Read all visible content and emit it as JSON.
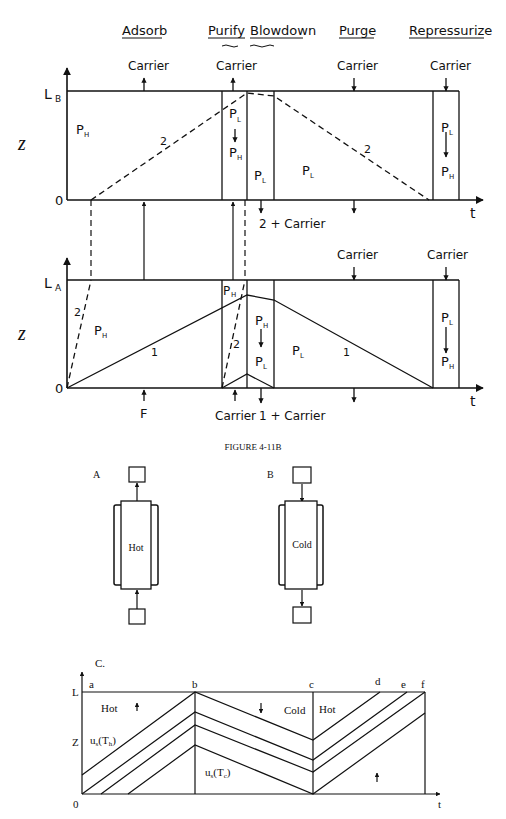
{
  "top_diagram": {
    "step_labels": [
      "Adsorb",
      "Purify",
      "Blowdown",
      "Purge",
      "Repressurize"
    ],
    "column_B": {
      "axis_top": "L",
      "axis_top_sub": "B",
      "axis_zero": "0",
      "y_axis_label": "z",
      "t_label": "t",
      "carrier_labels": [
        "Carrier",
        "Carrier",
        "Carrier",
        "Carrier"
      ],
      "regions": {
        "adsorb": "P",
        "adsorb_sub": "H",
        "purify_top": "P",
        "purify_top_sub": "L",
        "purify_bottom": "P",
        "purify_bottom_sub": "H",
        "blowdown": "P",
        "blowdown_sub": "L",
        "purge": "P",
        "purge_sub": "L",
        "repress_top": "P",
        "repress_top_sub": "L",
        "repress_bottom": "P",
        "repress_bottom_sub": "H"
      },
      "front_labels": [
        "2",
        "2"
      ],
      "outlet_label": "2 + Carrier"
    },
    "column_A": {
      "axis_top": "L",
      "axis_top_sub": "A",
      "axis_zero": "0",
      "y_axis_label": "z",
      "t_label": "t",
      "carrier_labels": [
        "Carrier",
        "Carrier"
      ],
      "regions": {
        "adsorb": "P",
        "adsorb_sub": "H",
        "purify": "P",
        "purify_sub": "H",
        "blowdown_top": "P",
        "blowdown_top_sub": "H",
        "blowdown_bottom": "P",
        "blowdown_bottom_sub": "L",
        "purge": "P",
        "purge_sub": "L",
        "repress_top": "P",
        "repress_top_sub": "L",
        "repress_bottom": "P",
        "repress_bottom_sub": "H"
      },
      "front_labels": [
        "2",
        "1",
        "2",
        "1"
      ],
      "feed_label": "F",
      "bottom_carrier": "Carrier",
      "outlet_label": "1 + Carrier"
    },
    "caption": "FIGURE 4-11B"
  },
  "column_sketches": {
    "A": {
      "label": "A",
      "text": "Hot",
      "flow": "up"
    },
    "B": {
      "label": "B",
      "text": "Cold",
      "flow": "down"
    }
  },
  "panel_c": {
    "label": "C.",
    "y_top": "L",
    "y_mid": "Z",
    "origin": "0",
    "x_label": "t",
    "point_labels": [
      "a",
      "b",
      "c",
      "d",
      "e",
      "f"
    ],
    "region_labels": {
      "hot_left": "Hot",
      "cold": "Cold",
      "hot_right": "Hot"
    },
    "velocity_hot": "u",
    "velocity_hot_sub": "s",
    "velocity_hot_arg": "(T",
    "velocity_hot_arg_sub": "h",
    "velocity_cold": "u",
    "velocity_cold_sub": "s",
    "velocity_cold_arg": "(T",
    "velocity_cold_arg_sub": "c",
    "close_paren": ")"
  }
}
